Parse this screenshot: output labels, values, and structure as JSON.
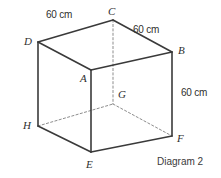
{
  "figure": {
    "caption": "Diagram 2",
    "shape": "cube",
    "solid_color": "#3a3a3a",
    "hidden_color": "#8d8d8d",
    "text_color": "#2f2f2f",
    "background": "#ffffff"
  },
  "vertices": [
    {
      "id": "C",
      "label": "C",
      "x": 113,
      "y": 20,
      "label_x": 108,
      "label_y": 6,
      "hidden": false
    },
    {
      "id": "D",
      "label": "D",
      "x": 38,
      "y": 42,
      "label_x": 24,
      "label_y": 36,
      "hidden": false
    },
    {
      "id": "B",
      "label": "B",
      "x": 172,
      "y": 52,
      "label_x": 178,
      "label_y": 45,
      "hidden": false
    },
    {
      "id": "A",
      "label": "A",
      "x": 91,
      "y": 70,
      "label_x": 80,
      "label_y": 73,
      "hidden": false
    },
    {
      "id": "G",
      "label": "G",
      "x": 113,
      "y": 104,
      "label_x": 118,
      "label_y": 89,
      "hidden": true
    },
    {
      "id": "H",
      "label": "H",
      "x": 38,
      "y": 126,
      "label_x": 23,
      "label_y": 120,
      "hidden": false
    },
    {
      "id": "F",
      "label": "F",
      "x": 172,
      "y": 136,
      "label_x": 177,
      "label_y": 133,
      "hidden": false
    },
    {
      "id": "E",
      "label": "E",
      "x": 91,
      "y": 152,
      "label_x": 86,
      "label_y": 159,
      "hidden": false
    }
  ],
  "edges": {
    "solid": [
      {
        "name": "edge-D-C",
        "from": "D",
        "to": "C"
      },
      {
        "name": "edge-C-B",
        "from": "C",
        "to": "B"
      },
      {
        "name": "edge-D-A",
        "from": "D",
        "to": "A"
      },
      {
        "name": "edge-A-B",
        "from": "A",
        "to": "B"
      },
      {
        "name": "edge-D-H",
        "from": "D",
        "to": "H"
      },
      {
        "name": "edge-A-E",
        "from": "A",
        "to": "E"
      },
      {
        "name": "edge-B-F",
        "from": "B",
        "to": "F"
      },
      {
        "name": "edge-H-E",
        "from": "H",
        "to": "E"
      },
      {
        "name": "edge-E-F",
        "from": "E",
        "to": "F"
      }
    ],
    "dashed": [
      {
        "name": "edge-C-G",
        "from": "C",
        "to": "G"
      },
      {
        "name": "edge-H-G",
        "from": "H",
        "to": "G"
      },
      {
        "name": "edge-G-F",
        "from": "G",
        "to": "F"
      }
    ]
  },
  "dimensions": [
    {
      "name": "dimension-DC",
      "text": "60 cm",
      "x": 46,
      "y": 10
    },
    {
      "name": "dimension-CB",
      "text": "60 cm",
      "x": 133,
      "y": 25
    },
    {
      "name": "dimension-BF",
      "text": "60 cm",
      "x": 181,
      "y": 88
    }
  ]
}
